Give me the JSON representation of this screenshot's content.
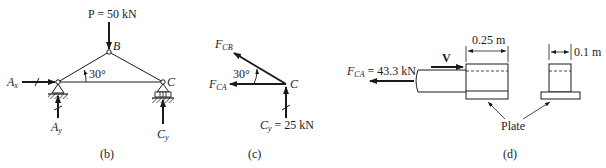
{
  "figure_b": {
    "caption": "(b)",
    "load_label": "P = 50 kN",
    "joint_b": "B",
    "joint_c": "C",
    "angle": "30°",
    "ax_main": "A",
    "ax_sub": "x",
    "ay_main": "A",
    "ay_sub": "y",
    "cy_main": "C",
    "cy_sub": "y"
  },
  "figure_c": {
    "caption": "(c)",
    "fcb_main": "F",
    "fcb_sub": "CB",
    "fca_main": "F",
    "fca_sub": "CA",
    "angle": "30°",
    "joint_c": "C",
    "cy_main": "C",
    "cy_sub": "y",
    "cy_value": " = 25 kN"
  },
  "figure_d": {
    "caption": "(d)",
    "fca_main": "F",
    "fca_sub": "CA",
    "fca_value": " = 43.3 kN",
    "shear_label": "V",
    "length_dim": "0.25 m",
    "width_dim": "0.1 m",
    "plate_label": "Plate"
  }
}
